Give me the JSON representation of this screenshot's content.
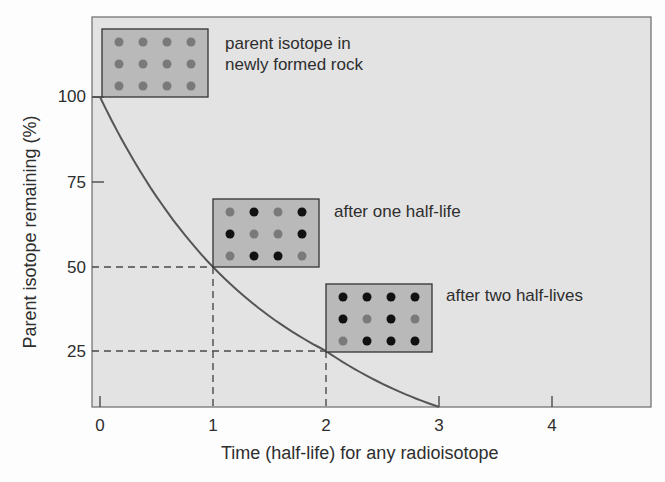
{
  "chart_data": {
    "type": "line",
    "title": "",
    "xlabel": "Time (half-life) for any radioisotope",
    "ylabel": "Parent isotope remaining (%)",
    "x_ticks": [
      "0",
      "1",
      "2",
      "3",
      "4"
    ],
    "y_ticks": [
      "25",
      "50",
      "75",
      "100"
    ],
    "xlim": [
      0,
      4.8
    ],
    "ylim": [
      12.5,
      107
    ],
    "grid": false,
    "series": [
      {
        "name": "Parent isotope remaining",
        "x": [
          0,
          0.5,
          1,
          1.5,
          2,
          2.5,
          3
        ],
        "y": [
          100,
          70.7,
          50,
          35.4,
          25,
          17.7,
          12.5
        ]
      }
    ],
    "reference_lines": [
      {
        "type": "dashed",
        "from": [
          0,
          50
        ],
        "to": [
          1,
          50
        ]
      },
      {
        "type": "dashed",
        "from": [
          1,
          12.5
        ],
        "to": [
          1,
          50
        ]
      },
      {
        "type": "dashed",
        "from": [
          0,
          25
        ],
        "to": [
          2,
          25
        ]
      },
      {
        "type": "dashed",
        "from": [
          2,
          12.5
        ],
        "to": [
          2,
          25
        ]
      }
    ],
    "annotations": [
      {
        "id": "newly-formed",
        "lines": [
          "parent isotope in",
          "newly formed rock"
        ],
        "dots": [
          [
            "p",
            "p",
            "p",
            "p"
          ],
          [
            "p",
            "p",
            "p",
            "p"
          ],
          [
            "p",
            "p",
            "p",
            "p"
          ]
        ]
      },
      {
        "id": "one-half-life",
        "lines": [
          "after one half-life"
        ],
        "dots": [
          [
            "p",
            "d",
            "p",
            "d"
          ],
          [
            "d",
            "p",
            "p",
            "d"
          ],
          [
            "p",
            "d",
            "d",
            "p"
          ]
        ]
      },
      {
        "id": "two-half-lives",
        "lines": [
          "after two half-lives"
        ],
        "dots": [
          [
            "d",
            "d",
            "d",
            "d"
          ],
          [
            "d",
            "p",
            "d",
            "p"
          ],
          [
            "p",
            "d",
            "d",
            "d"
          ]
        ]
      }
    ],
    "legend": {
      "p": "parent isotope atom (gray)",
      "d": "daughter isotope atom (black)"
    }
  },
  "colors": {
    "plot_bg": "#e3e3e3",
    "box_bg": "#b9b9b9",
    "parent_dot": "#7a7a7a",
    "daughter_dot": "#111111",
    "curve": "#555555",
    "axis": "#4a4a4a"
  },
  "labels": {
    "y_100": "100",
    "y_75": "75",
    "y_50": "50",
    "y_25": "25",
    "x_0": "0",
    "x_1": "1",
    "x_2": "2",
    "x_3": "3",
    "x_4": "4",
    "ann1_line1": "parent isotope in",
    "ann1_line2": "newly formed rock",
    "ann2": "after one half-life",
    "ann3": "after two half-lives",
    "xlabel": "Time (half-life) for any radioisotope",
    "ylabel": "Parent isotope remaining (%)"
  }
}
